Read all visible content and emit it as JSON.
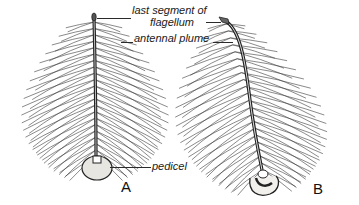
{
  "figure": {
    "labels": {
      "last_segment_line1": "last segment of",
      "last_segment_line2": "flagellum",
      "antennal_plume": "antennal plume",
      "pedicel": "pedicel"
    },
    "panels": [
      {
        "letter": "A",
        "description": "antenna with long plume hairs, straight shaft"
      },
      {
        "letter": "B",
        "description": "antenna with curved shaft and dense plume"
      }
    ],
    "colors": {
      "ink": "#2a2a2a",
      "background": "#ffffff",
      "pedicel_fill": "#e8e6e0"
    }
  }
}
